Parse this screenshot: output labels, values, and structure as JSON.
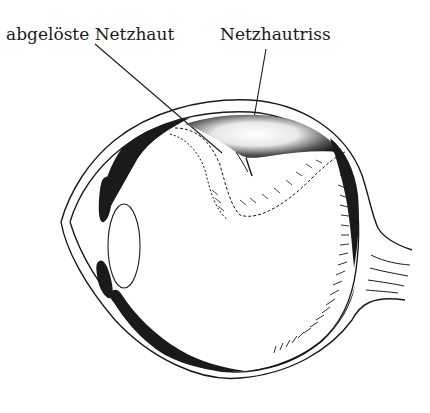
{
  "diagram": {
    "labels": [
      {
        "id": "detached-retina",
        "text": "abgelöste Netzhaut"
      },
      {
        "id": "retinal-tear",
        "text": "Netzhautriss"
      }
    ],
    "colors": {
      "ink": "#1a1a1a",
      "background": "#ffffff"
    }
  }
}
